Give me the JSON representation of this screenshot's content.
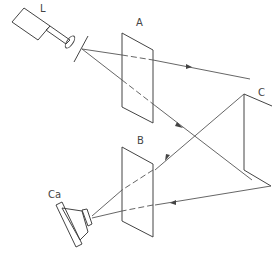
{
  "diagram": {
    "type": "optical-setup-schematic",
    "labels": {
      "laser": "L",
      "plate_a": "A",
      "plate_b": "B",
      "mirror": "C",
      "camera": "Ca"
    },
    "components": [
      {
        "id": "laser",
        "label": "L",
        "kind": "laser source"
      },
      {
        "id": "lens",
        "label": "",
        "kind": "lens"
      },
      {
        "id": "aperture",
        "label": "",
        "kind": "slit / aperture"
      },
      {
        "id": "plate_a",
        "label": "A",
        "kind": "plate"
      },
      {
        "id": "mirror",
        "label": "C",
        "kind": "mirror assembly"
      },
      {
        "id": "plate_b",
        "label": "B",
        "kind": "plate"
      },
      {
        "id": "camera",
        "label": "Ca",
        "kind": "camera"
      }
    ],
    "colors": {
      "line": "#444444",
      "background": "#ffffff"
    }
  }
}
